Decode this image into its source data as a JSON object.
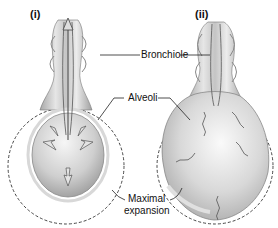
{
  "figure": {
    "panels": [
      {
        "id": "i",
        "label": "(i)",
        "state": "deflated alveolus with inward arrows"
      },
      {
        "id": "ii",
        "label": "(ii)",
        "state": "inflated alveolus with stretched fibers"
      }
    ],
    "labels": {
      "bronchiole": "Bronchiole",
      "alveoli": "Alveoli",
      "maximal_line1": "Maximal",
      "maximal_line2": "expansion"
    },
    "colors": {
      "outline": "#333333",
      "tissue_light": "#e8e8e8",
      "tissue_mid": "#bdbdbd",
      "tissue_dark": "#8a8a8a",
      "dashed": "#333333"
    }
  }
}
